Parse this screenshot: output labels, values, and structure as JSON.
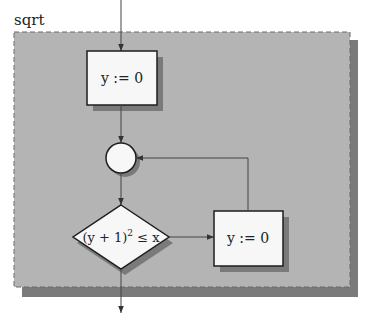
{
  "diagram": {
    "title": "sqrt",
    "colors": {
      "frame_fill": "#b4b4b4",
      "frame_shadow": "#7a7a7a",
      "node_fill": "#f7f7f7",
      "node_stroke": "#1e1e1e",
      "edge": "#444444"
    },
    "nodes": [
      {
        "id": "init",
        "type": "process",
        "label": "y := 0"
      },
      {
        "id": "join",
        "type": "connector",
        "label": ""
      },
      {
        "id": "cond",
        "type": "decision",
        "label_main": "(y + 1)",
        "label_sup": "2",
        "label_tail": " ≤ x"
      },
      {
        "id": "body",
        "type": "process",
        "label": "y := 0"
      }
    ],
    "edges": [
      {
        "from": "entry",
        "to": "init"
      },
      {
        "from": "init",
        "to": "join"
      },
      {
        "from": "join",
        "to": "cond"
      },
      {
        "from": "cond",
        "to": "body"
      },
      {
        "from": "body",
        "to": "join"
      },
      {
        "from": "cond",
        "to": "exit"
      }
    ]
  }
}
